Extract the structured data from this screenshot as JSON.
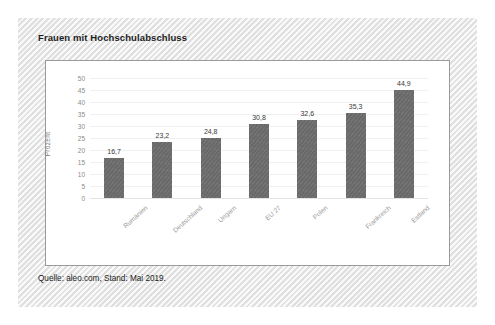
{
  "card": {
    "title": "Frauen mit Hochschulabschluss",
    "source_note": "Quelle: aleo.com, Stand: Mai 2019."
  },
  "colors": {
    "bar": "#6e6e6e",
    "card_background": "#e9e9e9",
    "plot_background": "#ffffff",
    "plot_border": "#9a9a9a",
    "gridline": "#f0f0f0",
    "tick_text": "#8a8a8a",
    "value_text": "#3a3a3a",
    "category_text": "#9d9d9d",
    "title_text": "#1d1d1d"
  },
  "chart_data": {
    "type": "bar",
    "title": "Frauen mit Hochschulabschluss",
    "subtitle": "",
    "xlabel": "",
    "ylabel": "Prozent",
    "ylim": [
      0,
      50
    ],
    "ytick_step": 5,
    "yticks": [
      "50",
      "45",
      "40",
      "35",
      "30",
      "25",
      "20",
      "15",
      "10",
      "5",
      "0"
    ],
    "grid": true,
    "legend": false,
    "orientation": "vertical",
    "categories": [
      "Rumänien",
      "Deutschland",
      "Ungarn",
      "EU 27",
      "Polen",
      "Frankreich",
      "Estland"
    ],
    "values": [
      16.7,
      23.2,
      24.8,
      30.8,
      32.6,
      35.3,
      44.9
    ],
    "value_labels": [
      "16,7",
      "23,2",
      "24,8",
      "30,8",
      "32,6",
      "35,3",
      "44,9"
    ],
    "source": "Quelle: aleo.com, Stand: Mai 2019."
  }
}
